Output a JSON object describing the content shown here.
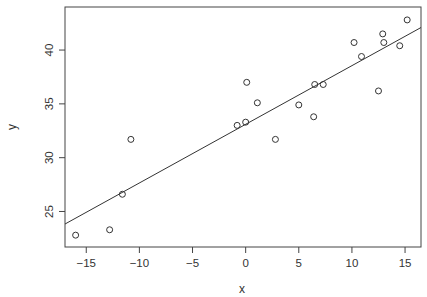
{
  "chart_data": {
    "type": "scatter",
    "title": "",
    "xlabel": "x",
    "ylabel": "y",
    "xlim": [
      -17.0,
      16.5
    ],
    "ylim": [
      21.7,
      44.0
    ],
    "grid": false,
    "legend": null,
    "x_ticks": [
      -15,
      -10,
      -5,
      0,
      5,
      10,
      15
    ],
    "y_ticks": [
      25,
      30,
      35,
      40
    ],
    "points": [
      {
        "x": -16.0,
        "y": 22.8
      },
      {
        "x": -12.8,
        "y": 23.3
      },
      {
        "x": -11.6,
        "y": 26.6
      },
      {
        "x": -10.8,
        "y": 31.7
      },
      {
        "x": -0.8,
        "y": 33.0
      },
      {
        "x": 0.0,
        "y": 33.3
      },
      {
        "x": 0.1,
        "y": 37.0
      },
      {
        "x": 1.1,
        "y": 35.1
      },
      {
        "x": 2.8,
        "y": 31.7
      },
      {
        "x": 5.0,
        "y": 34.9
      },
      {
        "x": 6.4,
        "y": 33.8
      },
      {
        "x": 6.5,
        "y": 36.8
      },
      {
        "x": 7.3,
        "y": 36.8
      },
      {
        "x": 10.2,
        "y": 40.7
      },
      {
        "x": 10.9,
        "y": 39.4
      },
      {
        "x": 12.5,
        "y": 36.2
      },
      {
        "x": 12.9,
        "y": 41.5
      },
      {
        "x": 13.0,
        "y": 40.7
      },
      {
        "x": 14.5,
        "y": 40.4
      },
      {
        "x": 15.2,
        "y": 42.8
      }
    ],
    "fit_line": {
      "type": "linear",
      "slope": 0.545,
      "intercept": 33.1
    },
    "marker": "open-circle",
    "colors": {
      "points": "#333333",
      "line": "#333333",
      "frame": "#444444"
    }
  }
}
